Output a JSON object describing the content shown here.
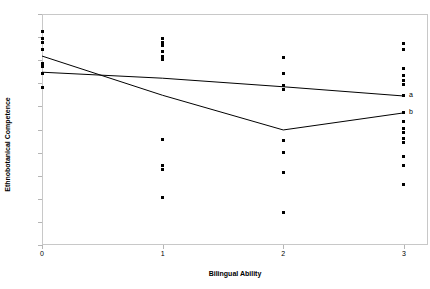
{
  "chart_data": {
    "type": "scatter",
    "title": "",
    "xlabel": "Bilingual Ability",
    "ylabel": "Ethnobotanical Competence",
    "xlim": [
      0,
      3.2
    ],
    "ylim": [
      0,
      1
    ],
    "grid": false,
    "legend": "none",
    "xticks": [
      "0",
      "1",
      "2",
      "3"
    ],
    "xtick_values": [
      0,
      1,
      2,
      3
    ],
    "yticks": [
      "0",
      "0.1",
      "0.2",
      "0.3",
      "0.4",
      "0.5",
      "0.6",
      "0.7",
      "0.8",
      "0.9",
      "1"
    ],
    "ytick_values": [
      0,
      0.1,
      0.2,
      0.3,
      0.4,
      0.5,
      0.6,
      0.7,
      0.8,
      0.9,
      1
    ],
    "marker": "filled-square",
    "marker_color": "#000000",
    "points": [
      {
        "x": 0,
        "y": 0.925
      },
      {
        "x": 0,
        "y": 0.895
      },
      {
        "x": 0,
        "y": 0.875
      },
      {
        "x": 0,
        "y": 0.845
      },
      {
        "x": 0,
        "y": 0.785
      },
      {
        "x": 0,
        "y": 0.772
      },
      {
        "x": 0,
        "y": 0.742
      },
      {
        "x": 0,
        "y": 0.682
      },
      {
        "x": 1,
        "y": 0.895
      },
      {
        "x": 1,
        "y": 0.878
      },
      {
        "x": 1,
        "y": 0.862
      },
      {
        "x": 1,
        "y": 0.838
      },
      {
        "x": 1,
        "y": 0.815
      },
      {
        "x": 1,
        "y": 0.805
      },
      {
        "x": 1,
        "y": 0.455
      },
      {
        "x": 1,
        "y": 0.345
      },
      {
        "x": 1,
        "y": 0.325
      },
      {
        "x": 1,
        "y": 0.205
      },
      {
        "x": 2,
        "y": 0.812
      },
      {
        "x": 2,
        "y": 0.742
      },
      {
        "x": 2,
        "y": 0.692
      },
      {
        "x": 2,
        "y": 0.672
      },
      {
        "x": 2,
        "y": 0.452
      },
      {
        "x": 2,
        "y": 0.402
      },
      {
        "x": 2,
        "y": 0.312
      },
      {
        "x": 2,
        "y": 0.142
      },
      {
        "x": 3,
        "y": 0.872
      },
      {
        "x": 3,
        "y": 0.845
      },
      {
        "x": 3,
        "y": 0.762
      },
      {
        "x": 3,
        "y": 0.735
      },
      {
        "x": 3,
        "y": 0.712
      },
      {
        "x": 3,
        "y": 0.695
      },
      {
        "x": 3,
        "y": 0.648
      },
      {
        "x": 3,
        "y": 0.572
      },
      {
        "x": 3,
        "y": 0.535
      },
      {
        "x": 3,
        "y": 0.505
      },
      {
        "x": 3,
        "y": 0.485
      },
      {
        "x": 3,
        "y": 0.462
      },
      {
        "x": 3,
        "y": 0.442
      },
      {
        "x": 3,
        "y": 0.385
      },
      {
        "x": 3,
        "y": 0.345
      },
      {
        "x": 3,
        "y": 0.262
      }
    ],
    "series": [
      {
        "name": "a",
        "label": "a",
        "type": "line",
        "color": "#000000",
        "x": [
          0,
          1,
          2,
          3
        ],
        "values": [
          0.748,
          0.722,
          0.685,
          0.645
        ]
      },
      {
        "name": "b",
        "label": "b",
        "type": "line",
        "color": "#000000",
        "x": [
          0,
          1,
          2,
          3
        ],
        "values": [
          0.818,
          0.648,
          0.498,
          0.572
        ]
      }
    ],
    "annotations": [
      {
        "text": "a",
        "x": 3,
        "y": 0.645
      },
      {
        "text": "b",
        "x": 3,
        "y": 0.572
      }
    ]
  }
}
